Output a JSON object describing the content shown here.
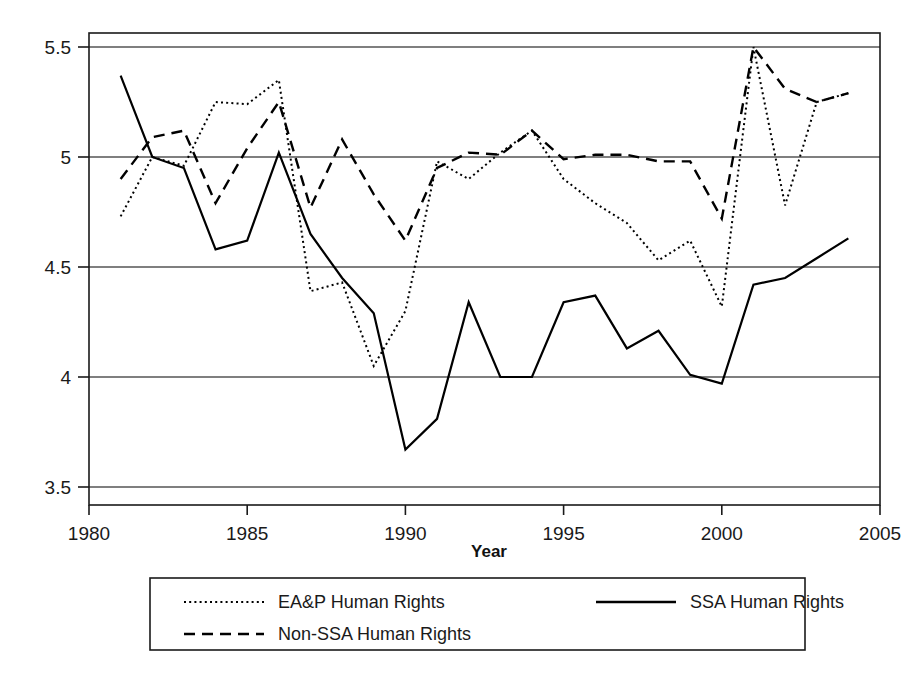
{
  "chart_data": {
    "type": "line",
    "title": "",
    "xlabel": "Year",
    "ylabel": "",
    "xlim": [
      1980,
      2005
    ],
    "ylim": [
      3.5,
      5.5
    ],
    "grid": true,
    "grid_axis": "y",
    "legend_position": "below-axis",
    "x_ticks": [
      "1980",
      "1985",
      "1990",
      "1995",
      "2000",
      "2005"
    ],
    "x_tick_values": [
      1980,
      1985,
      1990,
      1995,
      2000,
      2005
    ],
    "y_ticks": [
      "3.5",
      "4",
      "4.5",
      "5",
      "5.5"
    ],
    "y_tick_values": [
      3.5,
      4,
      4.5,
      5,
      5.5
    ],
    "x": [
      1981,
      1982,
      1983,
      1984,
      1985,
      1986,
      1987,
      1988,
      1989,
      1990,
      1991,
      1992,
      1993,
      1994,
      1995,
      1996,
      1997,
      1998,
      1999,
      2000,
      2001,
      2002,
      2003,
      2004
    ],
    "series": [
      {
        "name": "EA&P Human Rights",
        "style": "dotted",
        "color": "#000000",
        "values": [
          4.73,
          5.0,
          4.96,
          5.25,
          5.24,
          5.35,
          4.39,
          4.43,
          4.05,
          4.3,
          4.98,
          4.9,
          5.02,
          5.12,
          4.9,
          4.79,
          4.7,
          4.53,
          4.62,
          4.32,
          5.5,
          4.78,
          5.25,
          5.29
        ]
      },
      {
        "name": "SSA Human Rights",
        "style": "solid",
        "color": "#000000",
        "values": [
          5.37,
          5.0,
          4.95,
          4.58,
          4.62,
          5.02,
          4.65,
          4.45,
          4.29,
          3.67,
          3.81,
          4.34,
          4.0,
          4.0,
          4.34,
          4.37,
          4.13,
          4.21,
          4.01,
          3.97,
          4.42,
          4.45,
          4.54,
          4.63
        ]
      },
      {
        "name": "Non-SSA Human Rights",
        "style": "dashed",
        "color": "#000000",
        "values": [
          4.9,
          5.09,
          5.12,
          4.79,
          5.04,
          5.25,
          4.77,
          5.08,
          4.83,
          4.62,
          4.95,
          5.02,
          5.01,
          5.12,
          4.99,
          5.01,
          5.01,
          4.98,
          4.98,
          4.72,
          5.5,
          5.31,
          5.25,
          5.29
        ]
      }
    ]
  },
  "axes": {
    "x_title": "Year"
  },
  "legend": {
    "entries": [
      {
        "label": "EA&P Human Rights",
        "style": "dotted"
      },
      {
        "label": "SSA Human Rights",
        "style": "solid"
      },
      {
        "label": "Non-SSA Human Rights",
        "style": "dashed"
      }
    ]
  }
}
